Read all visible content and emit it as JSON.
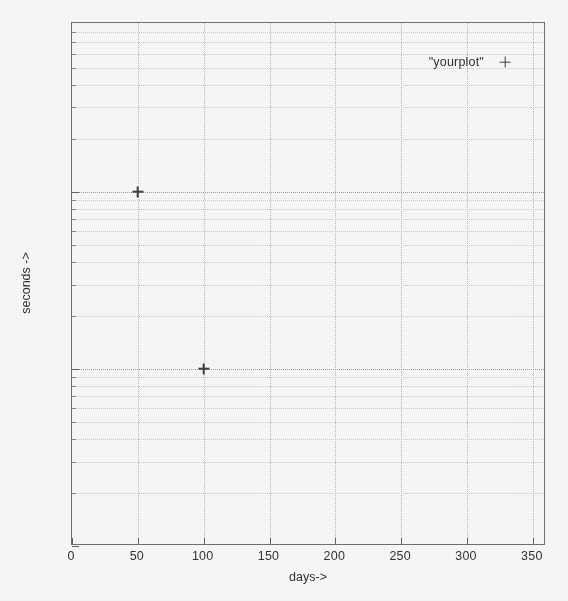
{
  "chart_data": {
    "type": "scatter",
    "title": "",
    "xlabel": "days->",
    "ylabel": "seconds ->",
    "xlim": [
      0,
      360
    ],
    "ylim": [
      1,
      900
    ],
    "yscale": "log",
    "xscale": "linear",
    "grid": true,
    "legend_position": "top-right",
    "x_ticks": [
      0,
      50,
      100,
      150,
      200,
      250,
      300,
      350
    ],
    "x_tick_labels": [
      "0",
      "50",
      "100",
      "150",
      "200",
      "250",
      "300",
      "350"
    ],
    "y_ticks": [
      1,
      10,
      100
    ],
    "y_tick_labels": [
      "1",
      "10",
      "100"
    ],
    "y_minor_ticks": [
      2,
      3,
      4,
      5,
      6,
      7,
      8,
      9,
      20,
      30,
      40,
      50,
      60,
      70,
      80,
      90,
      200,
      300,
      400,
      500,
      600,
      700,
      800
    ],
    "series": [
      {
        "name": "\"yourplot\"",
        "marker": "+",
        "color": "#3a3a3a",
        "x": [
          50,
          100
        ],
        "y": [
          100,
          10
        ],
        "points": [
          {
            "x": 50,
            "y": 100
          },
          {
            "x": 100,
            "y": 10
          }
        ]
      }
    ]
  },
  "legend": {
    "label": "\"yourplot\"",
    "marker_glyph": "+"
  },
  "axes": {
    "x_title": "days->",
    "y_title": "seconds ->"
  }
}
